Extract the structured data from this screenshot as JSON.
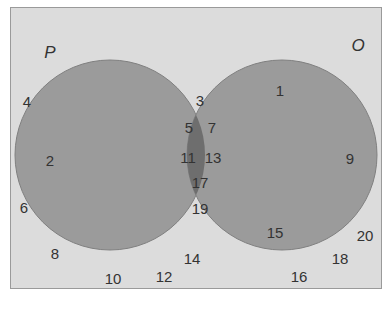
{
  "diagram": {
    "type": "venn",
    "colors": {
      "background": "#dcdcdc",
      "circle_fill": "#999999",
      "overlap_fill": "#6e6e6e",
      "border": "#9a9a9a",
      "text": "#333333"
    },
    "sets": [
      {
        "label": "P",
        "elements_only": [
          "2"
        ]
      },
      {
        "label": "O",
        "elements_only": [
          "1",
          "9",
          "15"
        ]
      }
    ],
    "intersection": [
      "3",
      "5",
      "7",
      "11",
      "13",
      "17",
      "19"
    ],
    "outside": [
      "4",
      "6",
      "8",
      "10",
      "12",
      "14",
      "16",
      "18",
      "20"
    ],
    "labels": {
      "P": "P",
      "O": "O",
      "n1": "1",
      "n2": "2",
      "n3": "3",
      "n4": "4",
      "n5": "5",
      "n6": "6",
      "n7": "7",
      "n8": "8",
      "n9": "9",
      "n10": "10",
      "n11": "11",
      "n12": "12",
      "n13": "13",
      "n14": "14",
      "n15": "15",
      "n16": "16",
      "n17": "17",
      "n18": "18",
      "n19": "19",
      "n20": "20"
    }
  }
}
